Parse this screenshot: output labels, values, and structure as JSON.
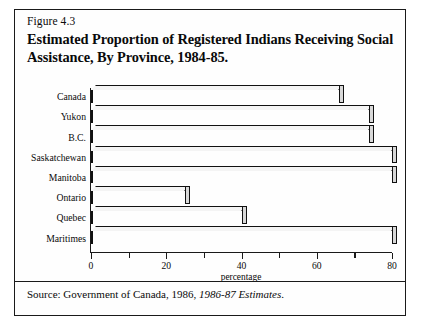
{
  "figure": {
    "number": "Figure 4.3",
    "title": "Estimated Proportion of Registered Indians Receiving Social Assistance, By Province, 1984-85.",
    "source_prefix": "Source: Government of Canada, 1986, ",
    "source_italic": "1986-87 Estimates",
    "source_suffix": "."
  },
  "chart_data": {
    "type": "bar",
    "orientation": "horizontal",
    "title": "Estimated Proportion of Registered Indians Receiving Social Assistance, By Province, 1984-85.",
    "xlabel": "percentage",
    "ylabel": "",
    "xlim": [
      0,
      80
    ],
    "xticks": [
      0,
      10,
      20,
      30,
      40,
      50,
      60,
      70,
      80
    ],
    "xtick_labels": [
      "0",
      "",
      "20",
      "",
      "40",
      "",
      "60",
      "",
      "80"
    ],
    "grid": false,
    "legend": false,
    "categories": [
      "Canada",
      "Yukon",
      "B.C.",
      "Saskatchewan",
      "Manitoba",
      "Ontario",
      "Quebec",
      "Maritimes"
    ],
    "values": [
      66,
      74,
      74,
      80,
      80,
      25,
      40,
      80
    ],
    "units": "percent",
    "bar_style": "3d-shadow",
    "colors": {
      "bar_face": "#232323",
      "bar_top": "#f4f4f4",
      "bar_side": "#d8d8d8",
      "axis": "#1a1a1a",
      "background": "#ffffff"
    }
  }
}
